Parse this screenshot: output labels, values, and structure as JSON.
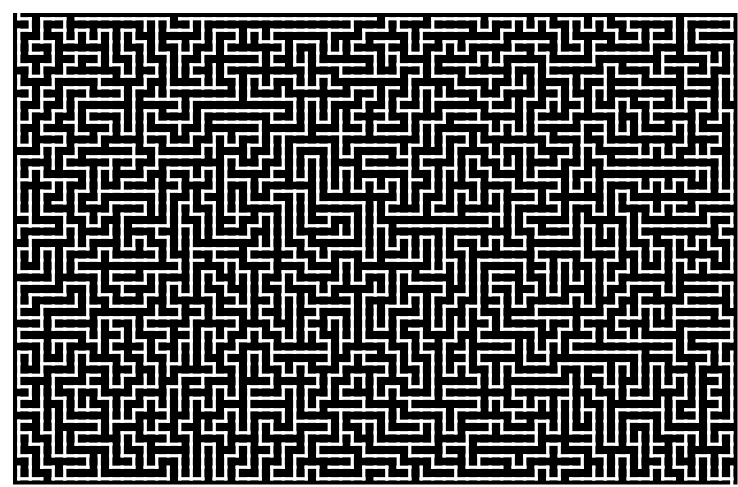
{
  "figure": {
    "kind": "maze-labyrinth"
  },
  "canvas": {
    "width": 738,
    "height": 487,
    "background_color": "#ffffff"
  },
  "maze": {
    "type": "perfect-maze-dfs",
    "columns": 63,
    "rows": 41,
    "seed": 20250411,
    "origin_x": 13,
    "origin_y": 13,
    "cell_pitch": 11.5,
    "corridor_width": 3.2,
    "wall_color": "#000000",
    "corridor_color": "#ffffff",
    "margin_left": 13,
    "margin_top": 13,
    "margin_right": 8,
    "margin_bottom": 9,
    "entrance": {
      "column": 0,
      "row": 0,
      "side": "top"
    },
    "exit": {
      "column": 62,
      "row": 40,
      "side": "bottom"
    },
    "outer_border": false
  }
}
